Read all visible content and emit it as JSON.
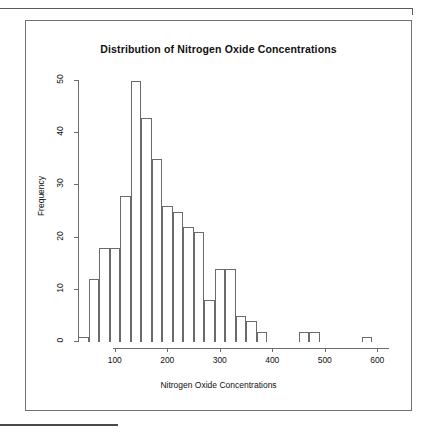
{
  "figure": {
    "title": "Distribution of Nitrogen Oxide Concentrations",
    "x_axis_title": "Nitrogen Oxide Concentrations",
    "y_axis_title": "Frequency"
  },
  "style": {
    "frame_color": "#707070",
    "bar_outline": "#6b6b6b",
    "bar_fill": "#ffffff",
    "text_color": "#111111",
    "rule_color": "#5a5a5a"
  },
  "chart_data": {
    "type": "bar",
    "title": "Distribution of Nitrogen Oxide Concentrations",
    "xlabel": "Nitrogen Oxide Concentrations",
    "ylabel": "Frequency",
    "xlim": [
      30,
      610
    ],
    "ylim": [
      0,
      50
    ],
    "grid": false,
    "legend": null,
    "bin_width": 20,
    "x_ticks": [
      100,
      200,
      300,
      400,
      500,
      600
    ],
    "y_ticks": [
      0,
      10,
      20,
      30,
      40,
      50
    ],
    "bin_starts": [
      30,
      50,
      70,
      90,
      110,
      130,
      150,
      170,
      190,
      210,
      230,
      250,
      270,
      290,
      310,
      330,
      350,
      370,
      390,
      410,
      430,
      450,
      470,
      490,
      510,
      530,
      550,
      570,
      590
    ],
    "bin_ends": [
      50,
      70,
      90,
      110,
      130,
      150,
      170,
      190,
      210,
      230,
      250,
      270,
      290,
      310,
      330,
      350,
      370,
      390,
      410,
      430,
      450,
      470,
      490,
      510,
      530,
      550,
      570,
      590,
      610
    ],
    "categories": [
      "30-50",
      "50-70",
      "70-90",
      "90-110",
      "110-130",
      "130-150",
      "150-170",
      "170-190",
      "190-210",
      "210-230",
      "230-250",
      "250-270",
      "270-290",
      "290-310",
      "310-330",
      "330-350",
      "350-370",
      "370-390",
      "390-410",
      "410-430",
      "430-450",
      "450-470",
      "470-490",
      "490-510",
      "510-530",
      "530-550",
      "550-570",
      "570-590",
      "590-610"
    ],
    "values": [
      1,
      12,
      18,
      18,
      28,
      50,
      43,
      35,
      26,
      25,
      22,
      21,
      8,
      14,
      14,
      5,
      4,
      2,
      0,
      0,
      0,
      2,
      2,
      0,
      0,
      0,
      0,
      1,
      0
    ]
  }
}
